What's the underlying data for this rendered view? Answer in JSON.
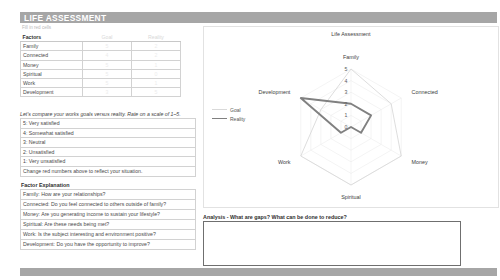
{
  "header": {
    "title": "LIFE ASSESSMENT",
    "fill_note": "Fill in red cells"
  },
  "factors_table": {
    "columns": [
      "Factors",
      "Goal",
      "Reality"
    ],
    "rows": [
      {
        "factor": "Family",
        "goal": "5",
        "reality": "2"
      },
      {
        "factor": "Connected",
        "goal": "4",
        "reality": "2"
      },
      {
        "factor": "Money",
        "goal": "5",
        "reality": "1"
      },
      {
        "factor": "Spiritual",
        "goal": "5",
        "reality": "0"
      },
      {
        "factor": "Work",
        "goal": "5",
        "reality": "1"
      },
      {
        "factor": "Development",
        "goal": "3",
        "reality": "5"
      }
    ]
  },
  "instruction": "Let's compare your works goals versus reality. Rate on a scale of 1–5.",
  "scale": {
    "items": [
      "5: Very satisfied",
      "4: Somewhat satisfied",
      "3: Neutral",
      "2: Unsatisfied",
      "1: Very unsatisfied"
    ],
    "footer": "Change red numbers above to reflect your situation."
  },
  "explanation": {
    "title": "Factor Explanation",
    "items": [
      "Family: How are your relationships?",
      "Connected: Do you feel connected to others outside of family?",
      "Money: Are you generating income to sustain your lifestyle?",
      "Spiritual: Are these needs being met?",
      "Work: Is the subject interesting and environment positive?",
      "Development: Do you have the opportunity to improve?"
    ]
  },
  "analysis": {
    "title": "Analysis - What are gaps? What can be done to reduce?",
    "value": ""
  },
  "legend": {
    "goal_label": "Goal",
    "reality_label": "Reality"
  },
  "colors": {
    "banner": "#a6a6a6",
    "goal_line": "#d9d9d9",
    "reality_line": "#808080",
    "grid": "#e8e8e8",
    "red_cell": "#ececec"
  },
  "chart_data": {
    "type": "radar",
    "title": "Life Assessment",
    "categories": [
      "Family",
      "Connected",
      "Money",
      "Spiritual",
      "Work",
      "Development"
    ],
    "tick_labels": [
      "0",
      "1",
      "2",
      "3",
      "4",
      "5"
    ],
    "rlim": [
      0,
      5
    ],
    "grid": true,
    "legend_position": "left",
    "series": [
      {
        "name": "Goal",
        "values": [
          5,
          4,
          5,
          5,
          5,
          3
        ]
      },
      {
        "name": "Reality",
        "values": [
          2,
          2,
          1,
          0,
          1,
          5
        ]
      }
    ]
  }
}
